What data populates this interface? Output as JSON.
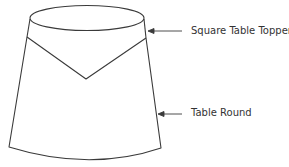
{
  "diagram": {
    "type": "labeled illustration",
    "stroke_color": "#3a3a3a",
    "labels": [
      {
        "id": "topper",
        "text": "Square Table Topper",
        "points_to": "top band / topper"
      },
      {
        "id": "round",
        "text": "Table Round",
        "points_to": "skirt side"
      }
    ]
  }
}
